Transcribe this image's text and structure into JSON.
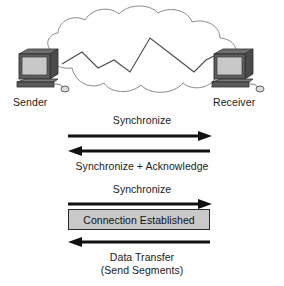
{
  "diagram": {
    "background_color": "#ffffff",
    "ink_color": "#1a1a1a"
  },
  "network": {
    "cloud_name": "network-cloud",
    "cloud_fill": "#ffffff",
    "cloud_stroke": "#8a8a8a",
    "path_name": "zigzag-network-path",
    "path_stroke": "#4a4a4a"
  },
  "endpoints": {
    "sender": {
      "label": "Sender",
      "icon": "desktop-computer-icon",
      "screen_color": "#c8c8c8",
      "case_color": "#5a5a5a"
    },
    "receiver": {
      "label": "Receiver",
      "icon": "desktop-computer-icon",
      "screen_color": "#c8c8c8",
      "case_color": "#5a5a5a"
    }
  },
  "messages": [
    {
      "id": "syn",
      "label": "Synchronize",
      "direction": "right",
      "label_position": "above",
      "arrow_color": "#111111"
    },
    {
      "id": "syn-ack",
      "label": "Synchronize + Acknowledge",
      "direction": "left",
      "label_position": "below",
      "arrow_color": "#111111"
    },
    {
      "id": "ack",
      "label": "Synchronize",
      "direction": "right",
      "label_position": "above",
      "arrow_color": "#111111"
    },
    {
      "id": "data",
      "label": "Data Transfer",
      "label_line2": "(Send Segments)",
      "direction": "left",
      "label_position": "below",
      "arrow_color": "#111111"
    }
  ],
  "state_banner": {
    "label": "Connection Established",
    "fill_color": "#c9c9c9",
    "border_color": "#2b2b2b"
  }
}
